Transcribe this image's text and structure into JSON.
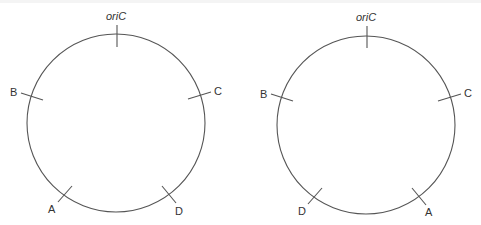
{
  "colors": {
    "stroke": "#555555",
    "text": "#333333",
    "background": "#ffffff"
  },
  "diagrams": [
    {
      "name": "chromosome-map-left",
      "labels": {
        "origin": "oriC",
        "markers": [
          "B",
          "C",
          "A",
          "D"
        ]
      }
    },
    {
      "name": "chromosome-map-right",
      "labels": {
        "origin": "oriC",
        "markers": [
          "B",
          "C",
          "D",
          "A"
        ]
      }
    }
  ],
  "left": {
    "origin": "oriC",
    "top_left": "B",
    "top_right": "C",
    "bottom_left": "A",
    "bottom_right": "D"
  },
  "right": {
    "origin": "oriC",
    "top_left": "B",
    "top_right": "C",
    "bottom_left": "D",
    "bottom_right": "A"
  }
}
